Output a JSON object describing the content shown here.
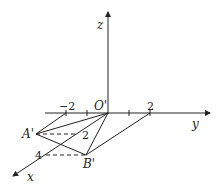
{
  "diagram": {
    "type": "oblique-projection-3d-axes",
    "stroke_color": "#222222",
    "background": "#ffffff",
    "axes": {
      "x": {
        "label": "x"
      },
      "y": {
        "label": "y"
      },
      "z": {
        "label": "z"
      }
    },
    "origin_label": "O'",
    "points": {
      "A": {
        "label": "A'"
      },
      "B": {
        "label": "B'"
      }
    },
    "tick_labels": {
      "y_neg2": "−2",
      "y_pos2": "2",
      "x_2": "2",
      "x_4": "4"
    }
  }
}
